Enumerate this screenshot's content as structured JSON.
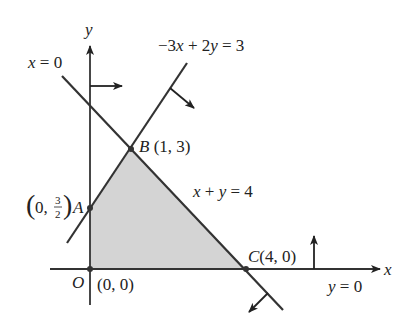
{
  "figure": {
    "type": "feasible-region-diagram",
    "axes": {
      "x_label": "x",
      "y_label": "y"
    },
    "colors": {
      "line": "#333333",
      "region_fill": "#d4d4d4",
      "text": "#222222",
      "background": "#ffffff"
    },
    "constraints": [
      {
        "equation": "x = 0",
        "label": "x = 0",
        "arrow_direction": "right"
      },
      {
        "equation": "-3x + 2y = 3",
        "label": "−3x + 2y = 3",
        "arrow_direction": "down-right"
      },
      {
        "equation": "x + y = 4",
        "label": "x + y = 4",
        "arrow_direction": "down-left"
      },
      {
        "equation": "y = 0",
        "label": "y = 0",
        "arrow_direction": "up"
      }
    ],
    "vertices": [
      {
        "name": "O",
        "coords": "(0, 0)",
        "x": 0,
        "y": 0
      },
      {
        "name": "A",
        "coords_prefix": "(0, ",
        "coords_num": "3",
        "coords_den": "2",
        "coords_suffix": ")",
        "x": 0,
        "y": 1.5
      },
      {
        "name": "B",
        "coords": "(1, 3)",
        "x": 1,
        "y": 3
      },
      {
        "name": "C",
        "coords": "(4, 0)",
        "x": 4,
        "y": 0
      }
    ],
    "feasible_region": "Quadrilateral O-A-B-C (shaded)"
  }
}
